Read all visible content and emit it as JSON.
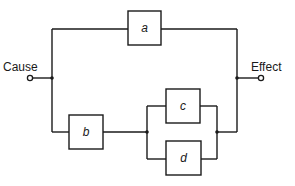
{
  "diagram": {
    "type": "block-diagram",
    "input": {
      "label": "Cause"
    },
    "output": {
      "label": "Effect"
    },
    "blocks": [
      {
        "id": "a",
        "label": "a"
      },
      {
        "id": "b",
        "label": "b"
      },
      {
        "id": "c",
        "label": "c"
      },
      {
        "id": "d",
        "label": "d"
      }
    ],
    "topology": "a in parallel with (b in series with (c parallel d))",
    "colors": {
      "line": "#1a1a1a",
      "background": "#ffffff"
    }
  }
}
